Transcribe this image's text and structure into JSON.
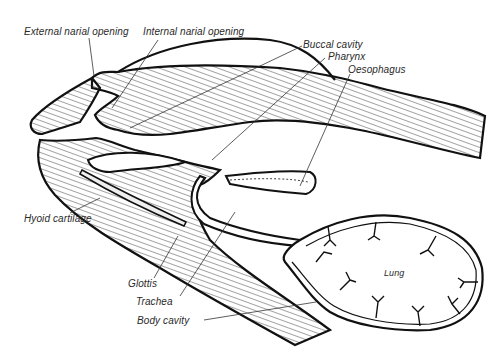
{
  "diagram": {
    "labels": {
      "external_narial_opening": "External narial opening",
      "internal_narial_opening": "Internal narial opening",
      "buccal_cavity": "Buccal cavity",
      "pharynx": "Pharynx",
      "oesophagus": "Oesophagus",
      "hyoid_cartilage": "Hyoid cartilage",
      "glottis": "Glottis",
      "trachea": "Trachea",
      "body_cavity": "Body cavity",
      "lung": "Lung"
    },
    "colors": {
      "line": "#111111",
      "hatch": "#333333",
      "background": "#ffffff"
    }
  }
}
